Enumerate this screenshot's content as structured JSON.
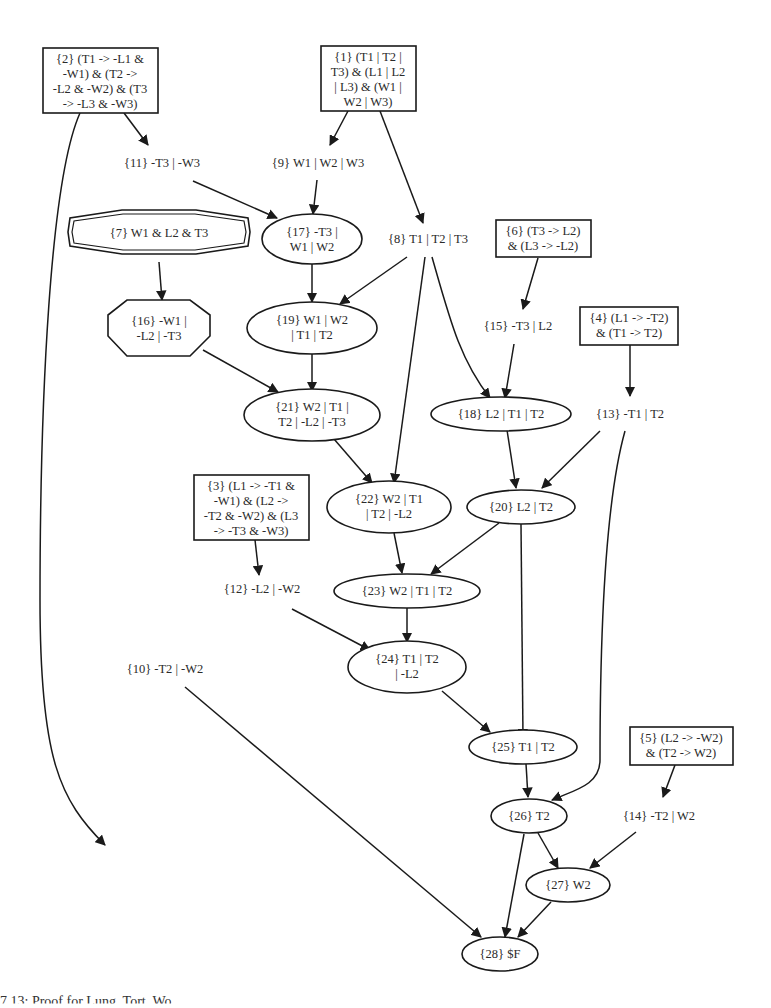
{
  "diagram": {
    "type": "resolution-proof-graph",
    "nodes": [
      {
        "id": 1,
        "shape": "box",
        "lines": [
          "{1} (T1 | T2 |",
          "T3) & (L1 | L2",
          "| L3) & (W1 |",
          "W2 | W3)"
        ]
      },
      {
        "id": 2,
        "shape": "box",
        "lines": [
          "{2} (T1 -> -L1 &",
          "-W1) & (T2 ->",
          "-L2 & -W2) & (T3",
          "-> -L3 & -W3)"
        ]
      },
      {
        "id": 3,
        "shape": "box",
        "lines": [
          "{3} (L1 -> -T1 &",
          "-W1) & (L2 ->",
          "-T2 & -W2) & (L3",
          "-> -T3 & -W3)"
        ]
      },
      {
        "id": 4,
        "shape": "box",
        "lines": [
          "{4} (L1 -> -T2)",
          "& (T1 -> T2)"
        ]
      },
      {
        "id": 5,
        "shape": "box",
        "lines": [
          "{5} (L2 -> -W2)",
          "& (T2 -> W2)"
        ]
      },
      {
        "id": 6,
        "shape": "box",
        "lines": [
          "{6} (T3 -> L2)",
          "& (L3 -> -L2)"
        ]
      },
      {
        "id": 7,
        "shape": "doubleoctagon",
        "lines": [
          "{7} W1 & L2 & T3"
        ]
      },
      {
        "id": 8,
        "shape": "plaintext",
        "lines": [
          "{8} T1 | T2 | T3"
        ]
      },
      {
        "id": 9,
        "shape": "plaintext",
        "lines": [
          "{9} W1 | W2 | W3"
        ]
      },
      {
        "id": 10,
        "shape": "plaintext",
        "lines": [
          "{10} -T2 | -W2"
        ]
      },
      {
        "id": 11,
        "shape": "plaintext",
        "lines": [
          "{11} -T3 | -W3"
        ]
      },
      {
        "id": 12,
        "shape": "plaintext",
        "lines": [
          "{12} -L2 | -W2"
        ]
      },
      {
        "id": 13,
        "shape": "plaintext",
        "lines": [
          "{13} -T1 | T2"
        ]
      },
      {
        "id": 14,
        "shape": "plaintext",
        "lines": [
          "{14} -T2 | W2"
        ]
      },
      {
        "id": 15,
        "shape": "plaintext",
        "lines": [
          "{15} -T3 | L2"
        ]
      },
      {
        "id": 16,
        "shape": "octagon",
        "lines": [
          "{16} -W1 |",
          "-L2 | -T3"
        ]
      },
      {
        "id": 17,
        "shape": "ellipse",
        "lines": [
          "{17} -T3 |",
          "W1 | W2"
        ]
      },
      {
        "id": 18,
        "shape": "ellipse",
        "lines": [
          "{18} L2 | T1 | T2"
        ]
      },
      {
        "id": 19,
        "shape": "ellipse",
        "lines": [
          "{19} W1 | W2",
          "| T1 | T2"
        ]
      },
      {
        "id": 20,
        "shape": "ellipse",
        "lines": [
          "{20} L2 | T2"
        ]
      },
      {
        "id": 21,
        "shape": "ellipse",
        "lines": [
          "{21} W2 | T1 |",
          "T2 | -L2 | -T3"
        ]
      },
      {
        "id": 22,
        "shape": "ellipse",
        "lines": [
          "{22} W2 | T1",
          "| T2 | -L2"
        ]
      },
      {
        "id": 23,
        "shape": "ellipse",
        "lines": [
          "{23} W2 | T1 | T2"
        ]
      },
      {
        "id": 24,
        "shape": "ellipse",
        "lines": [
          "{24} T1 | T2",
          "| -L2"
        ]
      },
      {
        "id": 25,
        "shape": "ellipse",
        "lines": [
          "{25} T1 | T2"
        ]
      },
      {
        "id": 26,
        "shape": "ellipse",
        "lines": [
          "{26} T2"
        ]
      },
      {
        "id": 27,
        "shape": "ellipse",
        "lines": [
          "{27} W2"
        ]
      },
      {
        "id": 28,
        "shape": "ellipse",
        "lines": [
          "{28} $F"
        ]
      }
    ],
    "edges": [
      [
        2,
        11
      ],
      [
        2,
        10
      ],
      [
        1,
        9
      ],
      [
        1,
        8
      ],
      [
        11,
        17
      ],
      [
        9,
        17
      ],
      [
        7,
        16
      ],
      [
        17,
        19
      ],
      [
        8,
        19
      ],
      [
        16,
        21
      ],
      [
        19,
        21
      ],
      [
        8,
        22
      ],
      [
        8,
        18
      ],
      [
        6,
        15
      ],
      [
        15,
        18
      ],
      [
        4,
        13
      ],
      [
        21,
        22
      ],
      [
        18,
        20
      ],
      [
        13,
        20
      ],
      [
        13,
        26
      ],
      [
        3,
        12
      ],
      [
        22,
        23
      ],
      [
        20,
        23
      ],
      [
        20,
        25
      ],
      [
        23,
        24
      ],
      [
        12,
        24
      ],
      [
        24,
        25
      ],
      [
        25,
        26
      ],
      [
        5,
        14
      ],
      [
        26,
        27
      ],
      [
        14,
        27
      ],
      [
        26,
        28
      ],
      [
        27,
        28
      ],
      [
        10,
        28
      ]
    ]
  },
  "caption": "7.13: Proof for Lung, Tort, Wo"
}
